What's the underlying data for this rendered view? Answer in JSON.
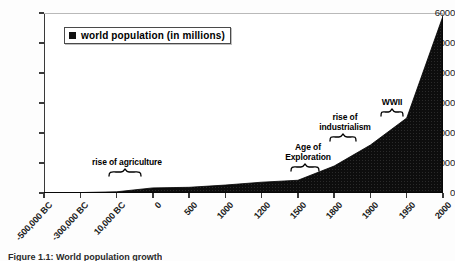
{
  "chart_data": {
    "type": "area",
    "title": "",
    "xlabel": "",
    "ylabel": "",
    "ylim": [
      0,
      6000
    ],
    "yticks": [
      0,
      1000,
      2000,
      3000,
      4000,
      5000,
      6000
    ],
    "ytick_labels": [
      "0",
      "1000",
      "2000",
      "3000",
      "4000",
      "5000",
      "6000"
    ],
    "grid": false,
    "legend_position": "upper-left-inside",
    "categories": [
      "-500,000 BC",
      "-300,000 BC",
      "10,000 BC",
      "0",
      "500",
      "1000",
      "1200",
      "1500",
      "1800",
      "1900",
      "1950",
      "2000"
    ],
    "series": [
      {
        "name": "world population (in millions)",
        "values": [
          10,
          15,
          40,
          170,
          190,
          265,
          360,
          425,
          900,
          1600,
          2500,
          5900
        ]
      }
    ],
    "annotations": [
      {
        "text": "rise of agriculture",
        "near_category": "10,000 BC",
        "approx_value": 300
      },
      {
        "text": "Age of Exploration",
        "near_category": "1500",
        "approx_value": 700
      },
      {
        "text": "rise of industrialism",
        "near_category": "1800",
        "approx_value": 1700
      },
      {
        "text": "WWII",
        "near_category": "1950",
        "approx_value": 2900
      }
    ]
  },
  "legend": {
    "label": "world population (in millions)",
    "swatch_color": "#101010"
  },
  "annotations": {
    "agriculture": "rise of agriculture",
    "exploration_line1": "Age of",
    "exploration_line2": "Exploration",
    "industrialism_line1": "rise of",
    "industrialism_line2": "industrialism",
    "wwii": "WWII"
  },
  "caption": "Figure 1.1:  World population growth",
  "colors": {
    "series_fill": "#101010",
    "axis": "#3a3a3a",
    "text": "#000000",
    "background": "#ffffff"
  }
}
